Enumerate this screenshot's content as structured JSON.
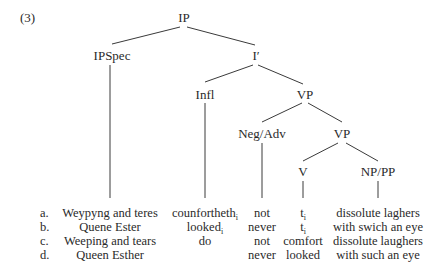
{
  "example_number": "(3)",
  "tree": {
    "nodes": {
      "ip": "IP",
      "ipspec": "IPSpec",
      "i_bar": "I′",
      "infl": "Infl",
      "vp1": "VP",
      "neg_adv": "Neg/Adv",
      "vp2": "VP",
      "v": "V",
      "np_pp": "NP/PP"
    }
  },
  "rows": [
    {
      "label": "a.",
      "ipspec": "Weypyng and teres",
      "infl": "counfortheth",
      "infl_sub": "i",
      "neg_adv": "not",
      "v": "t",
      "v_sub": "i",
      "np_pp": "dissolute laghers"
    },
    {
      "label": "b.",
      "ipspec": "Quene Ester",
      "infl": "looked",
      "infl_sub": "i",
      "neg_adv": "never",
      "v": "t",
      "v_sub": "i",
      "np_pp": "with swich an eye"
    },
    {
      "label": "c.",
      "ipspec": "Weeping and tears",
      "infl": "do",
      "infl_sub": "",
      "neg_adv": "not",
      "v": "comfort",
      "v_sub": "",
      "np_pp": "dissolute laughers"
    },
    {
      "label": "d.",
      "ipspec": "Queen Esther",
      "infl": "",
      "infl_sub": "",
      "neg_adv": "never",
      "v": "looked",
      "v_sub": "",
      "np_pp": "with such an eye"
    }
  ]
}
